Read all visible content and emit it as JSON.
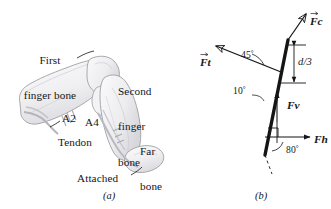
{
  "figure": {
    "width": 331,
    "height": 209,
    "background": "#ffffff",
    "ink": "#151515",
    "bone_fill": "#f2f2f3",
    "bone_stroke": "#9a9aa0",
    "bone_shade": "#d8d8dc"
  },
  "panel_a": {
    "caption": "(a)",
    "labels": {
      "first_bone_line1": "First",
      "first_bone_line2": "finger bone",
      "second_bone_line1": "Second",
      "second_bone_line2": "finger",
      "second_bone_line3": "bone",
      "far_bone_line1": "Far",
      "far_bone_line2": "bone",
      "pulley_a2": "A2",
      "pulley_a4": "A4",
      "tendon": "Tendon",
      "attached": "Attached"
    }
  },
  "panel_b": {
    "caption": "(b)",
    "forces": [
      {
        "id": "Fc",
        "symbol": "F",
        "subscript": "c",
        "name": "contact-force-vector",
        "has_overbar": true,
        "label_x": 310,
        "label_y": 11
      },
      {
        "id": "Ft",
        "symbol": "F",
        "subscript": "t",
        "name": "tendon-force-vector",
        "has_overbar": true,
        "label_x": 200,
        "label_y": 52
      },
      {
        "id": "Fv",
        "symbol": "F",
        "subscript": "v",
        "name": "vertical-force-vector",
        "has_overbar": false,
        "label_x": 287,
        "label_y": 95
      },
      {
        "id": "Fh",
        "symbol": "F",
        "subscript": "h",
        "name": "horizontal-force-vector",
        "has_overbar": false,
        "label_x": 314,
        "label_y": 135
      }
    ],
    "angles": [
      {
        "id": "a45",
        "value": "45",
        "unit": "°",
        "x": 241,
        "y": 54
      },
      {
        "id": "a10",
        "value": "10",
        "unit": "°",
        "x": 236,
        "y": 89
      },
      {
        "id": "a80",
        "value": "80",
        "unit": "°",
        "x": 294,
        "y": 148
      }
    ],
    "dimension": {
      "id": "d3",
      "label": "d/3",
      "x": 285,
      "y": 55
    },
    "right_angle_marker": "right-angle-marker"
  }
}
